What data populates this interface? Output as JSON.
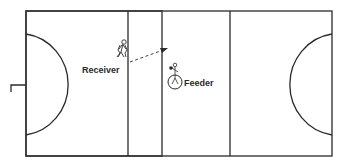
{
  "diagram": {
    "type": "netball-court-drill",
    "labels": {
      "receiver": "Receiver",
      "feeder": "Feeder"
    },
    "colors": {
      "line": "#2a2a2a",
      "background": "#ffffff"
    },
    "icons": {
      "receiver": "running-player-icon",
      "feeder": "player-with-ball-icon",
      "pass": "dashed-arrow-icon"
    }
  }
}
